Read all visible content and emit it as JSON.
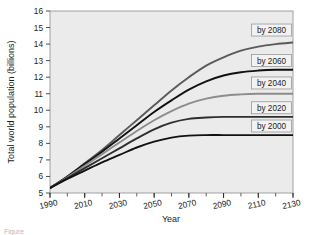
{
  "figure": {
    "caption_fragment": "Figure"
  },
  "chart_data": {
    "type": "line",
    "title": "",
    "xlabel": "Year",
    "ylabel": "Total world population (billions)",
    "xlim": [
      1990,
      2130
    ],
    "ylim": [
      5,
      16
    ],
    "grid": false,
    "background_color": "#ebebeb",
    "x_major_ticks": [
      1990,
      2010,
      2030,
      2050,
      2070,
      2090,
      2110,
      2130
    ],
    "x_major_tick_labels": [
      "1990",
      "2010",
      "2030",
      "2050",
      "2070",
      "2090",
      "2110",
      "2130"
    ],
    "x_minor_tick_step": 10,
    "y_ticks": [
      5,
      6,
      7,
      8,
      9,
      10,
      11,
      12,
      13,
      14,
      15,
      16
    ],
    "y_tick_labels": [
      "5",
      "6",
      "7",
      "8",
      "9",
      "10",
      "11",
      "12",
      "13",
      "14",
      "15",
      "16"
    ],
    "legend_position": "inline-right",
    "x": [
      1990,
      2000,
      2010,
      2020,
      2030,
      2040,
      2050,
      2060,
      2070,
      2080,
      2090,
      2100,
      2110,
      2120,
      2130
    ],
    "series": [
      {
        "name": "by 2080",
        "label": "by 2080",
        "color": "#5a5a5a",
        "plateau": 14.1,
        "values": [
          5.3,
          6.0,
          6.8,
          7.6,
          8.5,
          9.4,
          10.3,
          11.2,
          12.0,
          12.7,
          13.2,
          13.6,
          13.85,
          14.0,
          14.1
        ]
      },
      {
        "name": "by 2060",
        "label": "by 2060",
        "color": "#111111",
        "plateau": 12.45,
        "values": [
          5.3,
          6.0,
          6.75,
          7.5,
          8.3,
          9.1,
          9.9,
          10.6,
          11.25,
          11.75,
          12.1,
          12.3,
          12.4,
          12.45,
          12.45
        ]
      },
      {
        "name": "by 2040",
        "label": "by 2040",
        "color": "#8c8c8c",
        "plateau": 11.0,
        "values": [
          5.3,
          5.95,
          6.65,
          7.35,
          8.05,
          8.75,
          9.4,
          9.95,
          10.4,
          10.7,
          10.88,
          10.96,
          11.0,
          11.0,
          11.0
        ]
      },
      {
        "name": "by 2020",
        "label": "by 2020",
        "color": "#2e2e2e",
        "plateau": 9.6,
        "values": [
          5.3,
          5.9,
          6.5,
          7.1,
          7.7,
          8.3,
          8.85,
          9.25,
          9.48,
          9.56,
          9.6,
          9.6,
          9.6,
          9.6,
          9.6
        ]
      },
      {
        "name": "by 2000",
        "label": "by 2000",
        "color": "#111111",
        "plateau": 8.5,
        "values": [
          5.3,
          5.85,
          6.35,
          6.85,
          7.3,
          7.75,
          8.1,
          8.35,
          8.47,
          8.5,
          8.5,
          8.5,
          8.5,
          8.5,
          8.5
        ]
      }
    ],
    "series_label_boxes": [
      {
        "label": "by 2080",
        "y_value": 14.85
      },
      {
        "label": "by 2060",
        "y_value": 13.0
      },
      {
        "label": "by 2040",
        "y_value": 11.65
      },
      {
        "label": "by 2020",
        "y_value": 10.15
      },
      {
        "label": "by 2000",
        "y_value": 9.05
      }
    ]
  }
}
